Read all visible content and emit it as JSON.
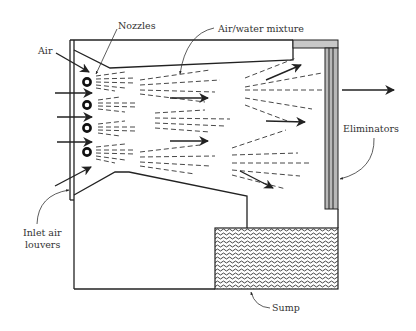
{
  "diagram": {
    "labels": {
      "nozzles": "Nozzles",
      "air_water_mixture": "Air/water mixture",
      "air": "Air",
      "eliminators": "Eliminators",
      "inlet_air_louvers_line1": "Inlet air",
      "inlet_air_louvers_line2": "louvers",
      "sump": "Sump"
    },
    "nozzle_count": 4,
    "colors": {
      "stroke": "#222222",
      "eliminator_fill": "#b8b8b8",
      "sump_pattern": "#555555",
      "label": "#333333"
    }
  }
}
